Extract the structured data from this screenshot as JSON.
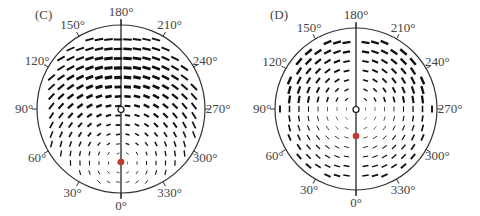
{
  "panels": [
    {
      "id": "C",
      "label": "(C)",
      "cx": 121,
      "cy": 109,
      "r": 84,
      "focus_offset": 0.0,
      "red_dot_offset": 53,
      "pattern": "radial-tangent-upper",
      "angle_labels": [
        "0°",
        "30°",
        "60°",
        "90°",
        "120°",
        "150°",
        "180°",
        "210°",
        "240°",
        "270°",
        "300°",
        "330°"
      ]
    },
    {
      "id": "D",
      "label": "(D)",
      "cx": 356,
      "cy": 109,
      "r": 81,
      "focus_offset": 0.0,
      "red_dot_offset": 27,
      "pattern": "concentric",
      "angle_labels": [
        "0°",
        "30°",
        "60°",
        "90°",
        "120°",
        "150°",
        "180°",
        "210°",
        "240°",
        "270°",
        "300°",
        "330°"
      ]
    }
  ],
  "colors": {
    "ink": "#111111",
    "circle": "#333333",
    "red_dot": "#c0392b",
    "label": "#444444"
  }
}
